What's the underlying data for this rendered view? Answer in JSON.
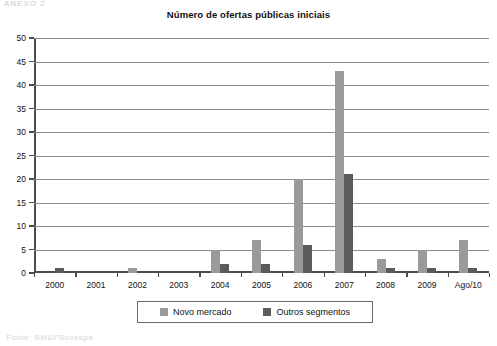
{
  "artifacts": {
    "top_text": "ANEXO 2",
    "bottom_text": "Fonte: BM&FBovespa"
  },
  "chart_data": {
    "type": "bar",
    "title": "Número de ofertas públicas iniciais",
    "xlabel": "",
    "ylabel": "",
    "ylim": [
      0,
      50
    ],
    "ytick_step": 5,
    "grid": true,
    "legend_position": "bottom",
    "categories": [
      "2000",
      "2001",
      "2002",
      "2003",
      "2004",
      "2005",
      "2006",
      "2007",
      "2008",
      "2009",
      "Ago/10"
    ],
    "ytick_labels": [
      "0",
      "5",
      "10",
      "15",
      "20",
      "25",
      "30",
      "35",
      "40",
      "45",
      "50"
    ],
    "series": [
      {
        "name": "Novo mercado",
        "color": "#9a9a9a",
        "values": [
          0,
          0,
          1,
          0,
          5,
          7,
          20,
          43,
          3,
          5,
          7
        ]
      },
      {
        "name": "Outros segmentos",
        "color": "#5b5b5b",
        "values": [
          1,
          0,
          0,
          0,
          2,
          2,
          6,
          21,
          1,
          1,
          1
        ]
      }
    ]
  }
}
